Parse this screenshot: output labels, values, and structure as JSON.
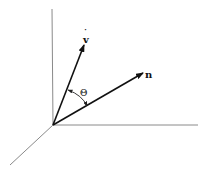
{
  "diagram": {
    "type": "3d-vector-angle",
    "labels": {
      "v": "v",
      "v_accent": "˙",
      "n": "n",
      "theta": "Θ"
    },
    "colors": {
      "axis": "#8a8a8a",
      "vector": "#111111",
      "background": "#ffffff"
    },
    "elements": [
      {
        "name": "z-axis",
        "from": [
          53,
          125
        ],
        "to": [
          52,
          9
        ]
      },
      {
        "name": "x-axis",
        "from": [
          53,
          125
        ],
        "to": [
          198,
          125
        ]
      },
      {
        "name": "y-axis",
        "from": [
          53,
          125
        ],
        "to": [
          10,
          165
        ]
      },
      {
        "name": "vector-v",
        "from": [
          53,
          125
        ],
        "to": [
          84,
          45
        ],
        "label": "v (dotted)"
      },
      {
        "name": "vector-n",
        "from": [
          53,
          125
        ],
        "to": [
          142,
          73
        ],
        "label": "n"
      },
      {
        "name": "angle-arc",
        "between": [
          "v",
          "n"
        ],
        "label": "Θ"
      }
    ]
  }
}
